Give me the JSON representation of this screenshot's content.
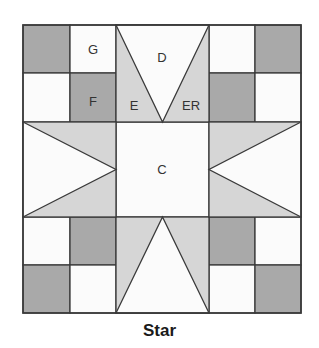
{
  "diagram": {
    "title": "Star",
    "colors": {
      "dark": "#a9a9a9",
      "medium": "#d6d6d6",
      "light": "#fbfbfb",
      "outline": "#3a3a3a"
    },
    "pieces": [
      {
        "label": "G",
        "shape": "square",
        "shade": "light"
      },
      {
        "label": "F",
        "shape": "square",
        "shade": "dark"
      },
      {
        "label": "D",
        "shape": "triangle",
        "shade": "light"
      },
      {
        "label": "E",
        "shape": "triangle",
        "shade": "medium"
      },
      {
        "label": "ER",
        "shape": "triangle",
        "shade": "medium"
      },
      {
        "label": "C",
        "shape": "square",
        "shade": "light"
      }
    ],
    "labels": {
      "G": "G",
      "F": "F",
      "D": "D",
      "E": "E",
      "ER": "ER",
      "C": "C"
    }
  }
}
